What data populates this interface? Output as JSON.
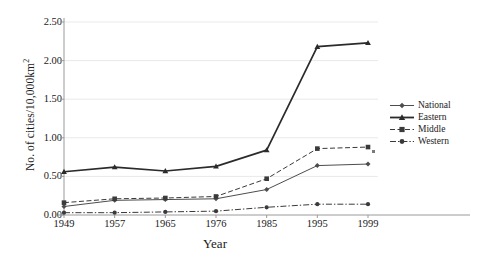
{
  "chart_data": {
    "type": "line",
    "title": "",
    "xlabel": "Year",
    "ylabel": "No. of cities/10,000km2",
    "ylabel_base": "No. of cities/10,000km",
    "ylabel_sup": "2",
    "categories": [
      "1949",
      "1957",
      "1965",
      "1976",
      "1985",
      "1995",
      "1999"
    ],
    "ylim": [
      0.0,
      2.5
    ],
    "yticks": [
      "0.00",
      "0.50",
      "1.00",
      "1.50",
      "2.00",
      "2.50"
    ],
    "ytick_values": [
      0.0,
      0.5,
      1.0,
      1.5,
      2.0,
      2.5
    ],
    "grid": "horizontal",
    "legend_position": "right",
    "series": [
      {
        "name": "National",
        "marker": "diamond",
        "line_style": "solid",
        "color": "#4d4d4d",
        "values": [
          0.11,
          0.19,
          0.2,
          0.21,
          0.33,
          0.64,
          0.66
        ]
      },
      {
        "name": "Eastern",
        "marker": "triangle",
        "line_style": "solid",
        "color": "#2b2b2b",
        "values": [
          0.56,
          0.62,
          0.57,
          0.63,
          0.84,
          2.18,
          2.23
        ]
      },
      {
        "name": "Middle",
        "marker": "square",
        "line_style": "dashed",
        "color": "#3a3a3a",
        "values": [
          0.16,
          0.21,
          0.22,
          0.24,
          0.47,
          0.86,
          0.88
        ]
      },
      {
        "name": "Western",
        "marker": "circle",
        "line_style": "dashdot",
        "color": "#3a3a3a",
        "values": [
          0.03,
          0.03,
          0.04,
          0.05,
          0.1,
          0.14,
          0.14
        ]
      }
    ]
  },
  "legend": {
    "items": [
      {
        "label": "National"
      },
      {
        "label": "Eastern"
      },
      {
        "label": "Middle"
      },
      {
        "label": "Western"
      }
    ]
  },
  "colors": {
    "grid": "#e9e9e9",
    "axis": "#9a9a9a",
    "text": "#1a1a1a",
    "background": "#ffffff"
  }
}
